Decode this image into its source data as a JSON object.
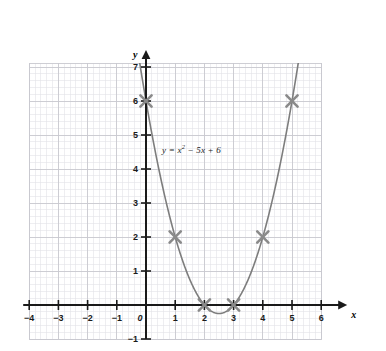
{
  "chart_data": {
    "type": "line",
    "title": "",
    "subtitle": "",
    "xlabel": "x",
    "ylabel": "y",
    "equation_label": "y = x² − 5x + 6",
    "equation_parts": {
      "lhs": "y =",
      "term1_base": "x",
      "term1_exp": "2",
      "rest": "− 5x + 6"
    },
    "function": "y = x^2 - 5x + 6",
    "xlim": [
      -4,
      6
    ],
    "ylim": [
      -1,
      7
    ],
    "xticks": [
      -4,
      -3,
      -2,
      -1,
      0,
      1,
      2,
      3,
      4,
      5,
      6
    ],
    "yticks": [
      -1,
      1,
      2,
      3,
      4,
      5,
      6,
      7
    ],
    "xtick_labels": [
      "-4",
      "-3",
      "-2",
      "-1",
      "0",
      "1",
      "2",
      "3",
      "4",
      "5",
      "6"
    ],
    "ytick_labels": [
      "-1",
      "1",
      "2",
      "3",
      "4",
      "5",
      "6",
      "7"
    ],
    "grid": true,
    "minor_grid": true,
    "minor_grid_step": 0.2,
    "legend": "none",
    "marked_points": [
      {
        "x": 0,
        "y": 6,
        "label": "(0, 6)"
      },
      {
        "x": 1,
        "y": 2,
        "label": "(1, 2)"
      },
      {
        "x": 2,
        "y": 0,
        "label": "(2, 0)"
      },
      {
        "x": 3,
        "y": 0,
        "label": "(3, 0)"
      },
      {
        "x": 4,
        "y": 2,
        "label": "(4, 2)"
      },
      {
        "x": 5,
        "y": 6,
        "label": "(5, 6)"
      }
    ],
    "vertex": {
      "x": 2.5,
      "y": -0.25
    },
    "roots": [
      2,
      3
    ],
    "y_intercept": 6,
    "curve_points_x": [
      -0.4,
      -0.2,
      0,
      0.25,
      0.5,
      0.75,
      1,
      1.25,
      1.5,
      1.75,
      2,
      2.25,
      2.5,
      2.75,
      3,
      3.25,
      3.5,
      3.75,
      4,
      4.25,
      4.5,
      4.75,
      5,
      5.2
    ],
    "colors": {
      "curve": "#7d7d7d",
      "marker": "#8a8a8a",
      "axis": "#1a1a1a",
      "major_grid": "#c9c9cf",
      "minor_grid": "#e2e2e8",
      "background": "#ffffff",
      "text": "#1a1a1a"
    }
  }
}
